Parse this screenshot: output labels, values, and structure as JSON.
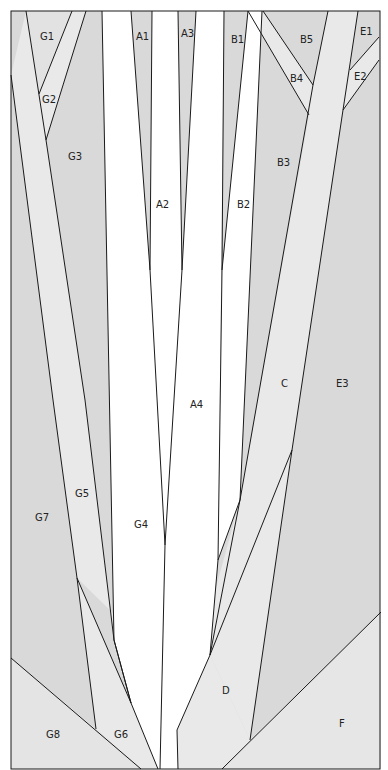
{
  "diagram": {
    "colors": {
      "dark": "#d9d9d9",
      "light": "#e9e9e9",
      "white": "#ffffff",
      "line": "#1a1a1a"
    },
    "labels": {
      "G1": "G1",
      "G2": "G2",
      "G3": "G3",
      "G4": "G4",
      "G5": "G5",
      "G6": "G6",
      "G7": "G7",
      "G8": "G8",
      "A1": "A1",
      "A2": "A2",
      "A3": "A3",
      "A4": "A4",
      "B1": "B1",
      "B2": "B2",
      "B3": "B3",
      "B4": "B4",
      "B5": "B5",
      "C": "C",
      "D": "D",
      "E1": "E1",
      "E2": "E2",
      "E3": "E3",
      "F": "F"
    }
  }
}
